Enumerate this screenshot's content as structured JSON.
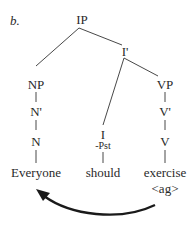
{
  "example_label": "b.",
  "tree": {
    "root": "IP",
    "i_bar": "I'",
    "np": "NP",
    "n_bar": "N'",
    "n": "N",
    "vp": "VP",
    "v_bar": "V'",
    "v": "V",
    "i": "I",
    "i_feature": "-Pst"
  },
  "words": {
    "subject": "Everyone",
    "modal": "should",
    "verb": "exercise",
    "verb_annotation": "<ag>"
  },
  "arrow": {
    "from": "exercise <ag>",
    "to": "Everyone",
    "color": "#1a1a1a"
  }
}
